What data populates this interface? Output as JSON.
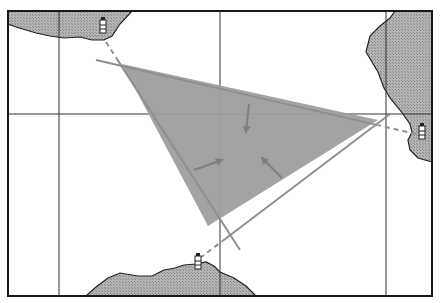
{
  "caption_fragment": "",
  "colors": {
    "background": "#ffffff",
    "frame": "#1a1a1a",
    "grid": "#333333",
    "land_fill": "#b4b4b4",
    "land_hatch": "#8a8a8a",
    "coast_line": "#222222",
    "triangle_fill": "#9e9e9e",
    "bearing_line": "#8f8f8f",
    "arrow": "#7f7f7f"
  },
  "frame": {
    "x": 8,
    "y": 11,
    "width": 424,
    "height": 285
  },
  "grid": {
    "vertical_x": [
      59,
      220,
      386
    ],
    "horizontal_y": [
      114
    ]
  },
  "landmasses": [
    {
      "name": "north-west-coast",
      "points": "8,11 132,11 120,24 112,36 104,40 92,40 80,37 64,38 50,36 36,33 26,30 16,27 8,24"
    },
    {
      "name": "east-coast",
      "points": "395,11 432,11 432,162 418,158 410,150 408,140 412,132 410,124 400,110 390,98 384,88 378,72 372,62 366,52 370,36 380,26 390,18"
    },
    {
      "name": "south-coast",
      "points": "86,296 96,287 108,278 120,273 138,276 152,276 164,270 175,268 184,265 196,264 206,262 214,266 220,272 234,278 246,286 256,296"
    }
  ],
  "lighthouses": [
    {
      "name": "lighthouse-north-west",
      "x": 103,
      "y": 26
    },
    {
      "name": "lighthouse-east",
      "x": 422,
      "y": 132
    },
    {
      "name": "lighthouse-south",
      "x": 198,
      "y": 262
    }
  ],
  "bearing_lines": [
    {
      "name": "bearing-line-north-west",
      "x1": 106,
      "y1": 42,
      "x2": 240,
      "y2": 250,
      "dashed_from": 0.0,
      "dashed_to": 0.08
    },
    {
      "name": "bearing-line-east",
      "x1": 416,
      "y1": 134,
      "x2": 96,
      "y2": 60,
      "dashed_from": 0.0,
      "dashed_to": 0.12
    },
    {
      "name": "bearing-line-south",
      "x1": 200,
      "y1": 258,
      "x2": 390,
      "y2": 114,
      "dashed_from": 0.0,
      "dashed_to": 0.12
    }
  ],
  "cocked_hat": {
    "points": "122,64 378,120 208,226"
  },
  "arrows": [
    {
      "name": "arrow-from-top",
      "x1": 249,
      "y1": 104,
      "x2": 246,
      "y2": 132
    },
    {
      "name": "arrow-from-left",
      "x1": 194,
      "y1": 170,
      "x2": 222,
      "y2": 160
    },
    {
      "name": "arrow-from-lower-right",
      "x1": 282,
      "y1": 178,
      "x2": 262,
      "y2": 158
    }
  ]
}
